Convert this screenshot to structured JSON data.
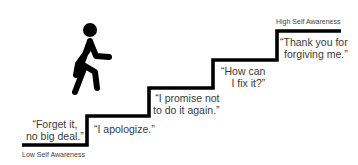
{
  "diagram": {
    "type": "staircase",
    "bottom_label": "Low Self Awareness",
    "top_label": "High Self Awareness",
    "steps": [
      {
        "line1": "“Forget it,",
        "line2": "no big deal.”"
      },
      {
        "line1": "“I apologize.”",
        "line2": ""
      },
      {
        "line1": "“I promise not",
        "line2": "to do it again.”"
      },
      {
        "line1": "“How can",
        "line2": "I fix it?”"
      },
      {
        "line1": "“Thank you for",
        "line2": "forgiving me.”"
      }
    ],
    "figure_icon": "walking-person-icon",
    "line_color": "#000000"
  }
}
